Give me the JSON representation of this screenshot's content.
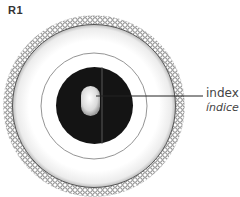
{
  "title": "R1",
  "labels": {
    "index_en": "index",
    "index_es": "índice"
  },
  "colors": {
    "disk": "#141414",
    "ring_line": "#888888",
    "bead": "#6a6a6a",
    "band": "#f3f3f3",
    "capsule": "#e6e6e6"
  },
  "geometry": {
    "center": [
      94,
      106
    ],
    "outer_radius": 87,
    "thin_ring_radius": 53,
    "disk_radius": 38
  }
}
